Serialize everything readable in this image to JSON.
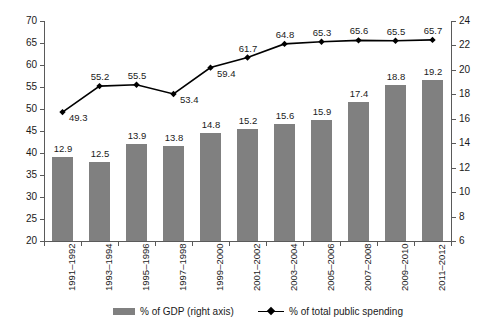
{
  "chart_data": {
    "type": "bar",
    "title": "",
    "subtitle": "",
    "xlabel": "",
    "ylabel": "",
    "categories": [
      "1991–1992",
      "1993–1994",
      "1995–1996",
      "1997–1998",
      "1999–2000",
      "2001–2002",
      "2003–2004",
      "2005–2006",
      "2007–2008",
      "2009–2010",
      "2011–2012"
    ],
    "series": [
      {
        "name": "% of GDP (right axis)",
        "type": "bar",
        "axis": "right",
        "color": "#808080",
        "values": [
          12.9,
          12.5,
          13.9,
          13.8,
          14.8,
          15.2,
          15.6,
          15.9,
          17.4,
          18.8,
          19.2
        ]
      },
      {
        "name": "% of total public spending",
        "type": "line",
        "axis": "left",
        "color": "#000000",
        "marker": "diamond",
        "values": [
          49.3,
          55.2,
          55.5,
          53.4,
          59.4,
          61.7,
          64.8,
          65.3,
          65.6,
          65.5,
          65.7
        ]
      }
    ],
    "left_axis": {
      "min": 20,
      "max": 70,
      "step": 5,
      "ticks": [
        20,
        25,
        30,
        35,
        40,
        45,
        50,
        55,
        60,
        65,
        70
      ]
    },
    "right_axis": {
      "min": 6,
      "max": 24,
      "step": 2,
      "ticks": [
        6,
        8,
        10,
        12,
        14,
        16,
        18,
        20,
        22,
        24
      ]
    },
    "grid": false,
    "legend_position": "bottom"
  },
  "legend": {
    "items": [
      {
        "label": "% of GDP (right axis)",
        "marker": "bar-swatch",
        "color": "#808080"
      },
      {
        "label": "% of total public spending",
        "marker": "line-diamond",
        "color": "#000000"
      }
    ]
  }
}
